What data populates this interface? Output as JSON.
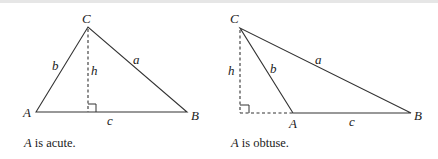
{
  "figure": {
    "left_panel": {
      "vertices": {
        "A": "A",
        "B": "B",
        "C": "C"
      },
      "sides": {
        "a": "a",
        "b": "b",
        "c": "c"
      },
      "altitude": "h",
      "caption_var": "A",
      "caption_text": " is acute."
    },
    "right_panel": {
      "vertices": {
        "A": "A",
        "B": "B",
        "C": "C"
      },
      "sides": {
        "a": "a",
        "b": "b",
        "c": "c"
      },
      "altitude": "h",
      "caption_var": "A",
      "caption_text": " is obtuse."
    }
  }
}
